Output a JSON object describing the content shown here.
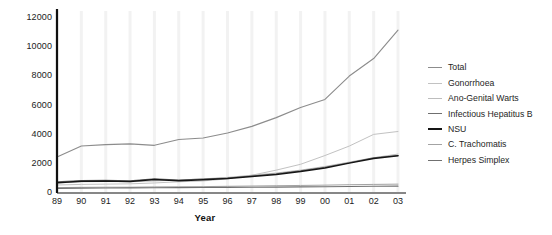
{
  "chart_data": {
    "type": "line",
    "title": "",
    "xlabel": "Year",
    "ylabel": "",
    "xlim": [
      0,
      14
    ],
    "ylim": [
      0,
      12000
    ],
    "yticks": [
      0,
      2000,
      4000,
      6000,
      8000,
      10000,
      12000
    ],
    "grid": "vertical-faint",
    "legend_position": "right",
    "categories": [
      "89",
      "90",
      "91",
      "92",
      "93",
      "94",
      "95",
      "96",
      "97",
      "98",
      "99",
      "00",
      "01",
      "02",
      "03"
    ],
    "series": [
      {
        "name": "Total",
        "color": "#8c8c8c",
        "width": 1.1,
        "values": [
          2400,
          3150,
          3250,
          3300,
          3200,
          3600,
          3700,
          4050,
          4500,
          5100,
          5800,
          6350,
          7950,
          9150,
          11100
        ]
      },
      {
        "name": "Gonorrhoea",
        "color": "#c2c2c2",
        "width": 1.0,
        "values": [
          480,
          520,
          540,
          560,
          620,
          700,
          760,
          900,
          1150,
          1500,
          1900,
          2500,
          3150,
          3950,
          4150
        ]
      },
      {
        "name": "Ano-Genital Warts",
        "color": "#bdbdbd",
        "width": 1.0,
        "values": [
          620,
          700,
          720,
          700,
          760,
          820,
          900,
          1000,
          1150,
          1300,
          1500,
          1750,
          2050,
          2350,
          2600
        ]
      },
      {
        "name": "Infectious Hepatitus B",
        "color": "#6f6f6f",
        "width": 1.1,
        "values": [
          700,
          780,
          800,
          760,
          900,
          820,
          880,
          960,
          1100,
          1250,
          1450,
          1700,
          2000,
          2350,
          2500
        ]
      },
      {
        "name": "NSU",
        "color": "#151515",
        "width": 1.5,
        "values": [
          640,
          730,
          760,
          720,
          860,
          780,
          840,
          920,
          1060,
          1200,
          1400,
          1650,
          1980,
          2300,
          2480
        ]
      },
      {
        "name": "C. Trachomatis",
        "color": "#a3a3a3",
        "width": 1.0,
        "values": [
          300,
          320,
          330,
          330,
          350,
          360,
          370,
          390,
          410,
          430,
          450,
          470,
          500,
          520,
          540
        ]
      },
      {
        "name": "Herpes Simplex",
        "color": "#707070",
        "width": 1.1,
        "values": [
          250,
          265,
          275,
          280,
          290,
          300,
          305,
          315,
          325,
          335,
          350,
          360,
          375,
          390,
          400
        ]
      }
    ]
  }
}
